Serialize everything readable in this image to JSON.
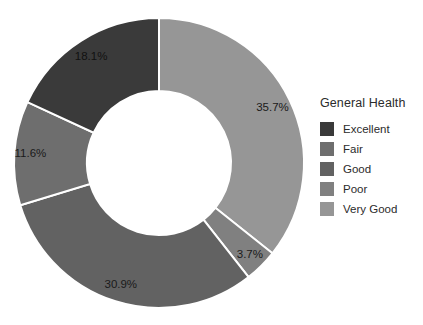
{
  "chart_data": {
    "type": "pie",
    "variant": "donut",
    "title": "",
    "legend_title": "General Health",
    "legend_position": "right",
    "grid": false,
    "start_angle_deg": 0,
    "direction": "clockwise",
    "center": {
      "x": 159,
      "y": 163
    },
    "outer_radius": 145,
    "inner_radius": 72,
    "label_format": "percent_one_decimal",
    "categories": [
      "Excellent",
      "Fair",
      "Good",
      "Poor",
      "Very Good"
    ],
    "values": [
      18.1,
      11.6,
      30.9,
      3.7,
      35.7
    ],
    "colors": [
      "#3a3a3a",
      "#6e6e6e",
      "#626262",
      "#808080",
      "#969696"
    ],
    "slices": [
      {
        "label": "Very Good",
        "value": 35.7,
        "display": "35.7%",
        "color": "#969696",
        "start_deg": 0.0,
        "end_deg": 128.52,
        "label_radius_frac": 0.74
      },
      {
        "label": "Poor",
        "value": 3.7,
        "display": "3.7%",
        "color": "#808080",
        "start_deg": 128.52,
        "end_deg": 141.84,
        "label_radius_frac": 0.78
      },
      {
        "label": "Good",
        "value": 30.9,
        "display": "30.9%",
        "color": "#626262",
        "start_deg": 141.84,
        "end_deg": 253.08,
        "label_radius_frac": 0.76
      },
      {
        "label": "Fair",
        "value": 11.6,
        "display": "11.6%",
        "color": "#6e6e6e",
        "start_deg": 253.08,
        "end_deg": 294.84,
        "label_radius_frac": 0.78
      },
      {
        "label": "Excellent",
        "value": 18.1,
        "display": "18.1%",
        "color": "#3a3a3a",
        "start_deg": 294.84,
        "end_deg": 360.0,
        "label_radius_frac": 0.74
      }
    ]
  },
  "legend": {
    "title": "General Health",
    "items": [
      {
        "label": "Excellent",
        "color": "#3a3a3a"
      },
      {
        "label": "Fair",
        "color": "#6e6e6e"
      },
      {
        "label": "Good",
        "color": "#626262"
      },
      {
        "label": "Poor",
        "color": "#808080"
      },
      {
        "label": "Very Good",
        "color": "#969696"
      }
    ]
  },
  "background_color": "#ffffff",
  "text_color": "#2b2b2b"
}
